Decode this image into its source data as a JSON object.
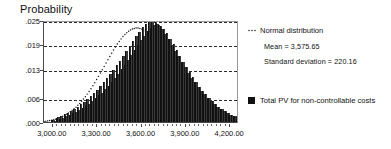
{
  "chart_data": {
    "type": "bar",
    "title": "Probability",
    "xlabel": "",
    "ylabel": "Probability",
    "ylim": [
      0.0,
      0.025
    ],
    "xlim": [
      2940,
      4260
    ],
    "grid": true,
    "ytick_labels": [
      ".025",
      ".019",
      ".013",
      ".006",
      ".000"
    ],
    "ytick_values": [
      0.025,
      0.019,
      0.013,
      0.006,
      0.0
    ],
    "xtick_labels": [
      "3,000.00",
      "3,300.00",
      "3,600.00",
      "3,900.00",
      "4,200.00"
    ],
    "xtick_values": [
      3000,
      3300,
      3600,
      3900,
      4200
    ],
    "legend_position": "right",
    "series": [
      {
        "name": "Total PV for non-controllable costs",
        "type": "histogram",
        "color": "#3a3a3a",
        "bin_width": 11,
        "bin_start": 2985,
        "values": [
          0.0004,
          0.0006,
          0.0003,
          0.0009,
          0.0012,
          0.0008,
          0.0015,
          0.0011,
          0.0019,
          0.0014,
          0.0023,
          0.0018,
          0.0027,
          0.0021,
          0.0032,
          0.0025,
          0.0038,
          0.0029,
          0.0043,
          0.0034,
          0.0049,
          0.0039,
          0.0056,
          0.0045,
          0.0063,
          0.0051,
          0.0071,
          0.0058,
          0.0079,
          0.0065,
          0.0088,
          0.0072,
          0.0097,
          0.008,
          0.0107,
          0.0089,
          0.0117,
          0.0098,
          0.0128,
          0.0108,
          0.0139,
          0.0118,
          0.015,
          0.0129,
          0.0162,
          0.014,
          0.0174,
          0.0152,
          0.0186,
          0.0164,
          0.0198,
          0.0176,
          0.021,
          0.0188,
          0.0221,
          0.02,
          0.0232,
          0.0211,
          0.0241,
          0.0222,
          0.0248,
          0.0231,
          0.025,
          0.0238,
          0.0246,
          0.024,
          0.0238,
          0.0236,
          0.0228,
          0.0228,
          0.0216,
          0.0217,
          0.0203,
          0.0204,
          0.0189,
          0.019,
          0.0175,
          0.0176,
          0.0161,
          0.0162,
          0.0147,
          0.0148,
          0.0134,
          0.0135,
          0.0121,
          0.0122,
          0.0109,
          0.011,
          0.0098,
          0.0098,
          0.0087,
          0.0087,
          0.0077,
          0.0077,
          0.0068,
          0.0068,
          0.0059,
          0.0059,
          0.0051,
          0.0051,
          0.0044,
          0.0044,
          0.0038,
          0.0038,
          0.0032,
          0.0032,
          0.0027,
          0.0027,
          0.0022,
          0.0022,
          0.0018,
          0.0018,
          0.0015,
          0.0015,
          0.0012,
          0.0012,
          0.0009,
          0.0009
        ]
      },
      {
        "name": "Normal distribution",
        "type": "line",
        "style": "dotted",
        "color": "#1a1a1a",
        "mean": 3575.65,
        "std": 220.16,
        "peak": 0.0235
      }
    ],
    "annotations": [
      "Mean = 3,575.65",
      "Standard deviation = 220.16"
    ]
  },
  "legend": {
    "normal_label": "Normal distribution",
    "normal_marker": "dotted-line-marker",
    "stats": [
      "Mean = 3,575.65",
      "Standard deviation = 220.16"
    ],
    "series_label": "Total PV for non-controllable costs",
    "series_swatch": "black-square-swatch"
  },
  "colors": {
    "bar": "#3a3a3a",
    "grid": "#2b2b2b",
    "axis": "#4a4a4a",
    "text": "#111111",
    "background": "#ffffff"
  }
}
